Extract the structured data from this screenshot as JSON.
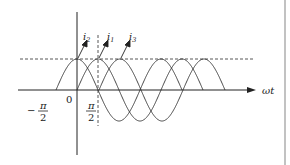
{
  "diagram": {
    "axes": {
      "x_label": "ωt",
      "origin_label": "0",
      "neg_tick": {
        "sign": "−",
        "num": "π",
        "den": "2"
      },
      "pos_tick": {
        "num": "π",
        "den": "2"
      }
    },
    "curves": [
      {
        "name": "i2",
        "label_base": "i",
        "label_sub": "2",
        "peak_phase": "0"
      },
      {
        "name": "i1",
        "label_base": "i",
        "label_sub": "1",
        "peak_phase": "π/2"
      },
      {
        "name": "i3",
        "label_base": "i",
        "label_sub": "3",
        "peak_phase": "π"
      }
    ],
    "colors": {
      "stroke": "#333333",
      "dash": "#444444",
      "border": "#999999"
    }
  }
}
